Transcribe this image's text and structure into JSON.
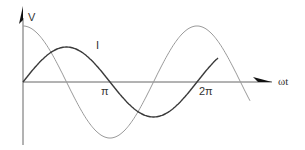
{
  "chart_data": {
    "type": "line",
    "title": "",
    "xlabel": "ωt",
    "ylabel": "V",
    "x_ticks": [
      "π",
      "2π"
    ],
    "series": [
      {
        "name": "V",
        "shape": "cosine",
        "color": "#9a9a9a",
        "amplitude": 1.0,
        "phase": "leads I by 90°"
      },
      {
        "name": "I",
        "shape": "sine",
        "color": "#3a3a3a",
        "amplitude": 0.6
      }
    ],
    "x_range": [
      "0",
      "~2.5π"
    ],
    "grid": false
  },
  "labels": {
    "v_axis": "V",
    "i_curve": "I",
    "pi": "π",
    "two_pi": "2π",
    "x_axis": "ωt"
  },
  "colors": {
    "axis": "#555555",
    "v_curve": "#9a9a9a",
    "i_curve": "#3a3a3a"
  }
}
